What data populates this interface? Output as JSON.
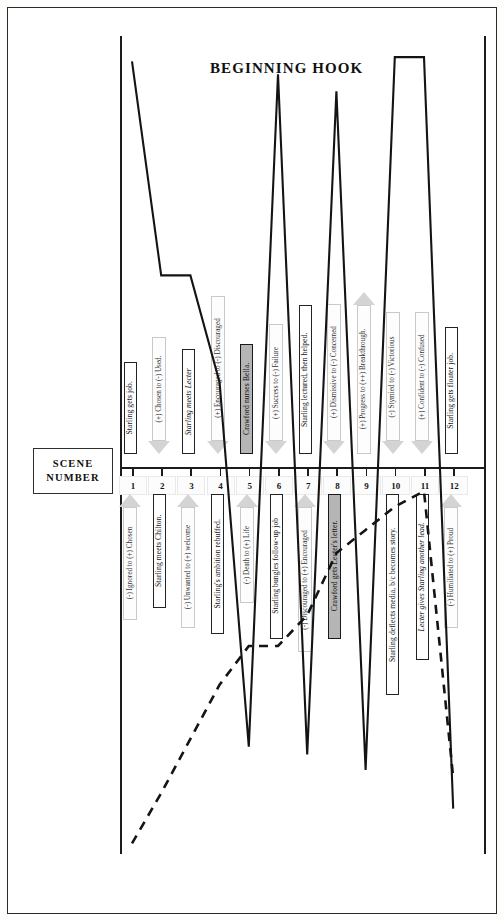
{
  "chart_data": {
    "type": "line",
    "title": "BEGINNING HOOK",
    "xlabel": "SCENE NUMBER",
    "ylabel": "",
    "grid": false,
    "legend_position": "none",
    "axis_label_box": {
      "line1": "SCENE",
      "line2": "NUMBER"
    },
    "categories": [
      "1",
      "2",
      "3",
      "4",
      "5",
      "6",
      "7",
      "8",
      "9",
      "10",
      "11",
      "12"
    ],
    "series": [
      {
        "name": "story-value-solid",
        "style": "solid",
        "values": [
          95,
          45,
          45,
          20,
          -72,
          92,
          -74,
          88,
          -78,
          96,
          96,
          -88
        ]
      },
      {
        "name": "character-arc-dashed",
        "style": "dashed",
        "values": [
          -97,
          -84,
          -70,
          -56,
          -46,
          -46,
          -38,
          -22,
          -16,
          -10,
          -6,
          -80
        ]
      }
    ],
    "scene_events_above": [
      {
        "scene": 1,
        "label": "Starling gets job.",
        "italic": false,
        "highlight": false
      },
      {
        "scene": 3,
        "label": "Starling meets Lecter",
        "italic": true,
        "highlight": false
      },
      {
        "scene": 5,
        "label": "Crawford nurses Bella.",
        "italic": false,
        "highlight": true
      },
      {
        "scene": 7,
        "label": "Starling lectured, then helped.",
        "italic": false,
        "highlight": false
      },
      {
        "scene": 9,
        "label": "Starling finds Raspail's head.",
        "italic": false,
        "highlight": false
      },
      {
        "scene": 12,
        "label": "Starling gets floater job.",
        "italic": false,
        "highlight": false
      }
    ],
    "scene_events_below": [
      {
        "scene": 2,
        "label": "Starling meets Chilton.",
        "italic": false,
        "highlight": false
      },
      {
        "scene": 4,
        "label": "Starling's ambition rebuffed.",
        "italic": false,
        "highlight": false
      },
      {
        "scene": 6,
        "label": "Starling bungles follow-up job",
        "italic": false,
        "highlight": false
      },
      {
        "scene": 8,
        "label": "Crawford gets Lecter's letter.",
        "italic": false,
        "highlight": true
      },
      {
        "scene": 10,
        "label": "Starling deflects media, b/c becomes story.",
        "italic": false,
        "highlight": false
      },
      {
        "scene": 11,
        "label": "Lecter gives Starling another lead.",
        "italic": true,
        "highlight": false
      }
    ],
    "value_shifts_above": [
      {
        "scene": 2,
        "label": "(+) Chosen to (-) Used.",
        "direction": "down"
      },
      {
        "scene": 4,
        "label": "(+) Encouraged to (-) Discouraged",
        "direction": "down"
      },
      {
        "scene": 6,
        "label": "(+) Success to (-) Failure",
        "direction": "down"
      },
      {
        "scene": 8,
        "label": "(+) Dismissive to (-) Concerned",
        "direction": "down"
      },
      {
        "scene": 9,
        "label": "(+) Progress to (++) Breakthrough.",
        "direction": "up"
      },
      {
        "scene": 10,
        "label": "(-) Stymied to (-) Victorious",
        "direction": "down"
      },
      {
        "scene": 11,
        "label": "(+) Confident to (-) Confused",
        "direction": "down"
      }
    ],
    "value_shifts_below": [
      {
        "scene": 1,
        "label": "(-) Ignored to (+) Chosen",
        "direction": "up"
      },
      {
        "scene": 3,
        "label": "(-) Unwanted to (+) welcome",
        "direction": "up"
      },
      {
        "scene": 5,
        "label": "(-) Death to (+) Life",
        "direction": "up"
      },
      {
        "scene": 7,
        "label": "(-) Discouraged to (+) Encouraged",
        "direction": "up"
      },
      {
        "scene": 12,
        "label": "(-) Humiliated to (+) Proud",
        "direction": "up"
      }
    ],
    "colors": {
      "ink": "#1c1c1c",
      "highlight_fill": "#b5b5b5",
      "arrow_fill": "#fdfdfd",
      "arrow_stroke": "#c9c9c9",
      "page": "#ffffff"
    }
  }
}
